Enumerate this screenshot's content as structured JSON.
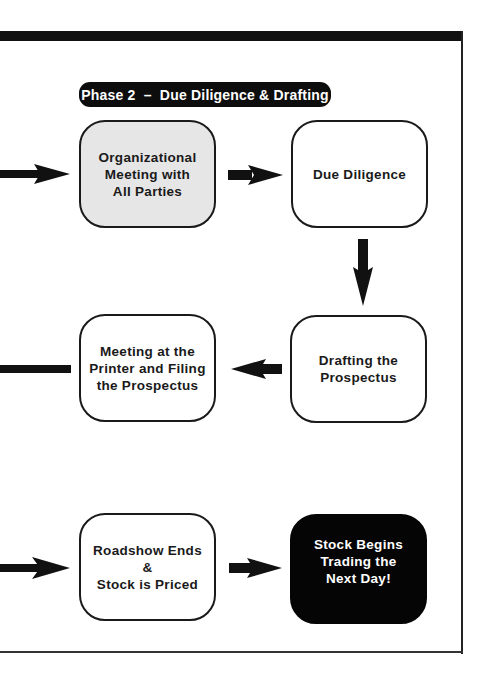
{
  "diagram": {
    "phase_label": "Phase 2  –  Due Diligence & Drafting",
    "colors": {
      "frame": "#111111",
      "box_border": "#1a1a1a",
      "highlight_box_fill": "#e6e6e6",
      "final_box_fill": "#050505",
      "final_box_text": "#ffffff"
    },
    "steps": [
      {
        "id": "organizational-meeting",
        "lines": [
          "Organizational",
          "Meeting with",
          "All Parties"
        ],
        "style": "gray"
      },
      {
        "id": "due-diligence",
        "lines": [
          "Due Diligence"
        ],
        "style": "white"
      },
      {
        "id": "drafting-prospectus",
        "lines": [
          "Drafting the",
          "Prospectus"
        ],
        "style": "white"
      },
      {
        "id": "printer-filing",
        "lines": [
          "Meeting at the",
          "Printer and Filing",
          "the Prospectus"
        ],
        "style": "white"
      },
      {
        "id": "roadshow-priced",
        "lines": [
          "Roadshow Ends &",
          "Stock is Priced"
        ],
        "style": "white"
      },
      {
        "id": "stock-trading",
        "lines": [
          "Stock Begins",
          "Trading the",
          "Next Day!"
        ],
        "style": "black"
      }
    ],
    "connections": [
      {
        "from": "offpage-left",
        "to": "organizational-meeting",
        "direction": "right"
      },
      {
        "from": "organizational-meeting",
        "to": "due-diligence",
        "direction": "right"
      },
      {
        "from": "due-diligence",
        "to": "drafting-prospectus",
        "direction": "down"
      },
      {
        "from": "drafting-prospectus",
        "to": "printer-filing",
        "direction": "left"
      },
      {
        "from": "printer-filing",
        "to": "offpage-left",
        "direction": "left"
      },
      {
        "from": "offpage-left",
        "to": "roadshow-priced",
        "direction": "right"
      },
      {
        "from": "roadshow-priced",
        "to": "stock-trading",
        "direction": "right"
      }
    ]
  }
}
